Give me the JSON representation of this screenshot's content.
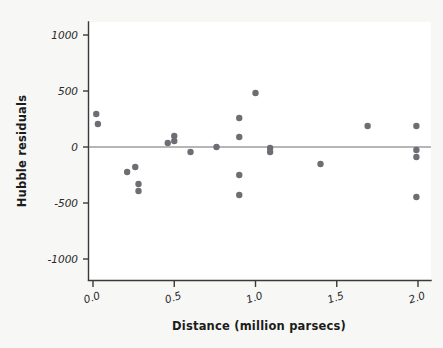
{
  "chart_data": {
    "type": "scatter",
    "title": "",
    "xlabel": "Distance (million parsecs)",
    "ylabel": "Hubble residuals",
    "xlim": [
      -0.06,
      2.08
    ],
    "ylim": [
      -1180,
      1180
    ],
    "xticks": [
      0.0,
      0.5,
      1.0,
      1.5,
      2.0
    ],
    "xticklabels": [
      "0.0",
      "0.5",
      "1.0",
      "1.5",
      "2.0"
    ],
    "yticks": [
      -1000,
      -500,
      0,
      500,
      1000
    ],
    "yticklabels": [
      "-1000",
      "-500",
      "0",
      "500",
      "1000"
    ],
    "grid": false,
    "legend": null,
    "reference_lines": [
      {
        "axis": "horizontal",
        "value": 0,
        "color": "#6e6e6e"
      }
    ],
    "marker": {
      "shape": "circle",
      "color": "#6d6d73",
      "size": 3.2
    },
    "points": [
      {
        "x": 0.02,
        "y": 295
      },
      {
        "x": 0.03,
        "y": 205
      },
      {
        "x": 0.21,
        "y": -223
      },
      {
        "x": 0.26,
        "y": -179
      },
      {
        "x": 0.28,
        "y": -330
      },
      {
        "x": 0.28,
        "y": -393
      },
      {
        "x": 0.46,
        "y": 36
      },
      {
        "x": 0.5,
        "y": 98
      },
      {
        "x": 0.5,
        "y": 54
      },
      {
        "x": 0.6,
        "y": -45
      },
      {
        "x": 0.76,
        "y": 0
      },
      {
        "x": 0.9,
        "y": 259
      },
      {
        "x": 0.9,
        "y": 89
      },
      {
        "x": 0.9,
        "y": -250
      },
      {
        "x": 0.9,
        "y": -429
      },
      {
        "x": 1.0,
        "y": 482
      },
      {
        "x": 1.09,
        "y": -9
      },
      {
        "x": 1.09,
        "y": -45
      },
      {
        "x": 1.4,
        "y": -152
      },
      {
        "x": 1.69,
        "y": 188
      },
      {
        "x": 1.99,
        "y": 188
      },
      {
        "x": 1.99,
        "y": -27
      },
      {
        "x": 1.99,
        "y": -89
      },
      {
        "x": 1.99,
        "y": -446
      }
    ]
  },
  "axes": {
    "x_title": "Distance (million parsecs)",
    "y_title": "Hubble residuals"
  },
  "colors": {
    "marker": "#6d6d73",
    "axis": "#3a3a3a",
    "zero_line": "#6e6e6e",
    "panel": "#ffffff",
    "figure_bg": "#f7f7f5"
  }
}
